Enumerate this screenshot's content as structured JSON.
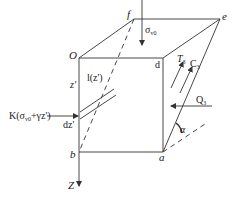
{
  "diagram": {
    "type": "3D block force diagram",
    "colors": {
      "stroke": "#333333",
      "text": "#222222",
      "background": "#ffffff"
    },
    "vertices": {
      "O": "O",
      "f": "f",
      "e": "e",
      "d": "d",
      "b": "b",
      "a": "a"
    },
    "axis": {
      "z_label": "Z"
    },
    "labels": {
      "sigma_v0": "σ",
      "sigma_v0_sub": "v0",
      "z_prime": "z'",
      "dz_prime": "dz'",
      "l_z": "l(z')",
      "K_expr": "K(σ",
      "K_expr_sub": "v0",
      "K_expr_rest": "+γz')",
      "T3": "T",
      "T3_sub": "3",
      "C3": "C",
      "C3_sub": "3",
      "Q3": "Q",
      "Q3_sub": "3",
      "alpha": "α"
    }
  }
}
